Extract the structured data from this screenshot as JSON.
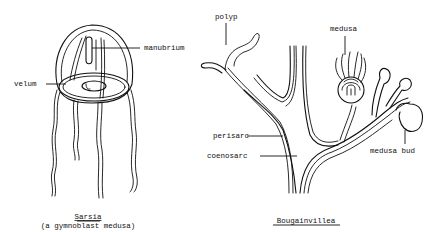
{
  "figures": [
    {
      "name": "sarsia",
      "caption_title": "Sarsia",
      "caption_subtitle": "(a gymnoblast medusa)",
      "labels": {
        "manubrium": "manubrium",
        "velum": "velum"
      }
    },
    {
      "name": "bougainvillea",
      "caption_title": "Bougainvillea",
      "labels": {
        "polyp": "polyp",
        "medusa": "medusa",
        "perisarc": "perisarc",
        "coenosarc": "coenosarc",
        "medusa_bud": "medusa bud"
      }
    }
  ],
  "colors": {
    "ink": "#111111",
    "background": "#ffffff"
  }
}
